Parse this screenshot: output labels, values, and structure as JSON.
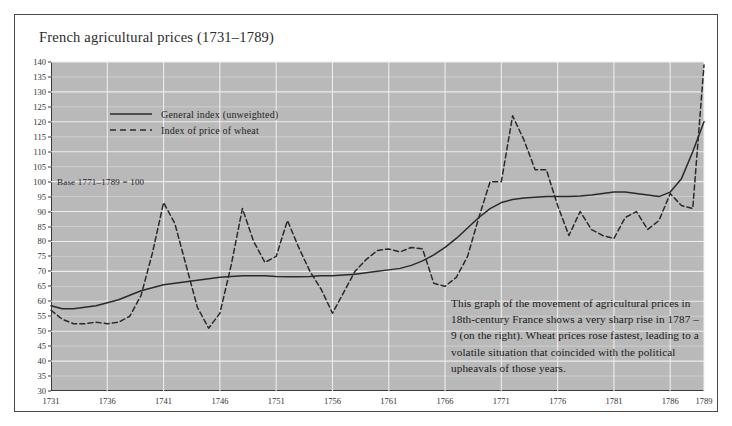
{
  "card": {
    "title": "French agricultural prices (1731–1789)",
    "base_note": "Base 1771–1789 = 100",
    "caption": "This graph of the movement of agricultural prices in 18th-century France shows a very sharp rise in 1787 – 9 (on the right). Wheat prices rose fastest, leading to a volatile situation that coincided with the political upheavals of those years.",
    "plot_bg": "#b9b9b9",
    "grid_color": "#f0f0f0",
    "line_color": "#2a2a2a"
  },
  "chart_data": {
    "type": "line",
    "title": "French agricultural prices (1731–1789)",
    "xlabel": "",
    "ylabel": "",
    "xlim": [
      1731,
      1789
    ],
    "ylim": [
      30,
      140
    ],
    "ytick_step": 5,
    "yticks": [
      30,
      35,
      40,
      45,
      50,
      55,
      60,
      65,
      70,
      75,
      80,
      85,
      90,
      95,
      100,
      105,
      110,
      115,
      120,
      125,
      130,
      135,
      140
    ],
    "xticks": [
      1731,
      1736,
      1741,
      1746,
      1751,
      1756,
      1761,
      1766,
      1771,
      1776,
      1781,
      1786,
      1789
    ],
    "grid": true,
    "legend_position": "upper-left-inside",
    "annotations": [
      {
        "text": "Base 1771–1789 = 100",
        "x": 1731,
        "y": 100
      },
      {
        "text": "This graph of the movement of agricultural prices in 18th-century France shows a very sharp rise in 1787 – 9 (on the right). Wheat prices rose fastest, leading to a volatile situation that coincided with the political upheavals of those years.",
        "x": 1766,
        "y": 60
      }
    ],
    "x": [
      1731,
      1732,
      1733,
      1734,
      1735,
      1736,
      1737,
      1738,
      1739,
      1740,
      1741,
      1742,
      1743,
      1744,
      1745,
      1746,
      1747,
      1748,
      1749,
      1750,
      1751,
      1752,
      1753,
      1754,
      1755,
      1756,
      1757,
      1758,
      1759,
      1760,
      1761,
      1762,
      1763,
      1764,
      1765,
      1766,
      1767,
      1768,
      1769,
      1770,
      1771,
      1772,
      1773,
      1774,
      1775,
      1776,
      1777,
      1778,
      1779,
      1780,
      1781,
      1782,
      1783,
      1784,
      1785,
      1786,
      1787,
      1788,
      1789
    ],
    "series": [
      {
        "name": "General index (unweighted)",
        "style": "solid",
        "values": [
          58.5,
          57.5,
          57.5,
          58.0,
          58.5,
          59.5,
          60.5,
          62.0,
          63.5,
          64.5,
          65.5,
          66.0,
          66.5,
          67.0,
          67.5,
          68.0,
          68.3,
          68.5,
          68.5,
          68.5,
          68.3,
          68.2,
          68.2,
          68.3,
          68.5,
          68.5,
          68.8,
          69.0,
          69.5,
          70.0,
          70.5,
          71.0,
          72.0,
          73.5,
          75.5,
          78.0,
          81.0,
          84.5,
          88.0,
          91.0,
          93.0,
          94.0,
          94.5,
          94.8,
          95.0,
          95.0,
          95.0,
          95.2,
          95.5,
          96.0,
          96.5,
          96.5,
          96.0,
          95.5,
          95.0,
          96.5,
          101.0,
          110.0,
          120.0
        ]
      },
      {
        "name": "Index of price of wheat",
        "style": "dashed",
        "values": [
          57.0,
          54.0,
          52.5,
          52.5,
          53.0,
          52.5,
          53.0,
          55.0,
          62.0,
          76.0,
          93.0,
          86.0,
          72.0,
          58.0,
          51.0,
          56.0,
          72.0,
          91.0,
          80.0,
          73.0,
          75.0,
          87.0,
          78.0,
          70.0,
          64.0,
          56.0,
          63.0,
          70.0,
          74.0,
          77.0,
          77.5,
          76.5,
          78.0,
          77.5,
          66.0,
          65.0,
          68.0,
          75.0,
          88.0,
          100.0,
          100.0,
          122.0,
          114.0,
          104.0,
          104.0,
          92.0,
          82.0,
          90.0,
          84.0,
          82.0,
          81.0,
          88.0,
          90.0,
          84.0,
          87.0,
          96.0,
          92.0,
          91.0,
          139.0
        ]
      }
    ]
  }
}
